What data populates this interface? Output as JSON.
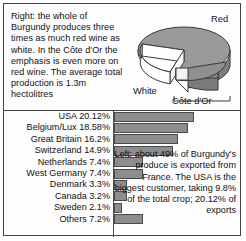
{
  "top_panel": {
    "intro_text": "Right: the whole of Burgundy produces three times as much red wine as white. In the Côte d'Or the emphasis is even more on red wine. The average total production is 1.3m hectolitres",
    "labels": {
      "red": "Red",
      "white": "White",
      "cote_dor": "Côte d'Or"
    }
  },
  "bottom_panel": {
    "note_text": "Left: about 49% of Burgundy's produce is exported from France. The USA is the biggest customer, taking 9.8% of the total crop; 20.12% of exports"
  },
  "chart_data": [
    {
      "type": "pie",
      "title": "Burgundy wine production",
      "labels": [
        "Red",
        "White"
      ],
      "values": [
        75,
        25
      ],
      "annotations": [
        "Côte d'Or"
      ],
      "notes": "Whole of Burgundy produces three times as much red wine as white; average total production 1.3m hectolitres. An exploded wedge marks the Côte d'Or.",
      "legend": "none",
      "colors": {
        "red_slice": "#9a9a9a",
        "white_slice": "#ffffff",
        "side_wall": "#8a8a8a"
      }
    },
    {
      "type": "bar",
      "orientation": "horizontal",
      "title": "Burgundy wine exports by destination",
      "xlabel": "",
      "ylabel": "",
      "grid": false,
      "legend": "none",
      "xlim": [
        0,
        20.12
      ],
      "categories": [
        "USA",
        "Belgium/Lux",
        "Great Britain",
        "Switzerland",
        "Netherlands",
        "West Germany",
        "Denmark",
        "Canada",
        "Sweden",
        "Others"
      ],
      "values": [
        20.12,
        18.58,
        16.2,
        14.9,
        7.4,
        7.4,
        3.3,
        3.2,
        2.1,
        7.2
      ],
      "tick_labels": [
        "USA 20.12%",
        "Belgium/Lux 18.58%",
        "Great Britain 16.2%",
        "Switzerland 14.9%",
        "Netherlands 7.4%",
        "West Germany 7.4%",
        "Denmark 3.3%",
        "Canada 3.2%",
        "Sweden 2.1%",
        "Others 7.2%"
      ],
      "bar_color": "#8d8d8d",
      "bar_border_color": "#4a4a4a"
    }
  ]
}
